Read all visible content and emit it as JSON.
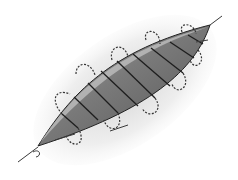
{
  "illustration": {
    "subject": "running-suture-wound-closure",
    "colors": {
      "background": "#ffffff",
      "skin_shadow": "#e4e4e4",
      "wound_dark": "#5a5a5a",
      "wound_mid": "#8c8c8c",
      "wound_light": "#b4b4b4",
      "wound_edge_highlight": "#d2d2d2",
      "suture": "#1e1e1e",
      "thread_tail": "#3a3a3a"
    }
  }
}
